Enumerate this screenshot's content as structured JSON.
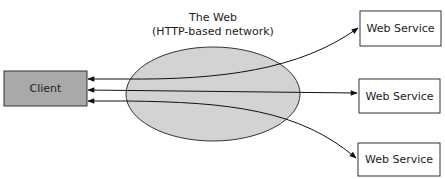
{
  "diagram": {
    "cloud": {
      "title": "The Web",
      "subtitle": "(HTTP-based network)",
      "fill": "#d3d3d3",
      "stroke": "#333333"
    },
    "client": {
      "label": "Client",
      "fill": "#a9a9a9",
      "stroke": "#333333"
    },
    "services": [
      {
        "label": "Web Service"
      },
      {
        "label": "Web Service"
      },
      {
        "label": "Web Service"
      }
    ],
    "connections": [
      {
        "from": "Client",
        "to": "Web Service 1",
        "bidirectional": true
      },
      {
        "from": "Client",
        "to": "Web Service 2",
        "bidirectional": true
      },
      {
        "from": "Client",
        "to": "Web Service 3",
        "bidirectional": true
      }
    ]
  }
}
